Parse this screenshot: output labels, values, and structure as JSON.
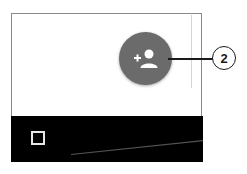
{
  "screen": {
    "fab": {
      "icon": "add-person-icon",
      "color": "#6b6b6b"
    },
    "navbar": {
      "icon": "square-icon",
      "background": "#000000"
    }
  },
  "annotation": {
    "callout_number": "2"
  }
}
